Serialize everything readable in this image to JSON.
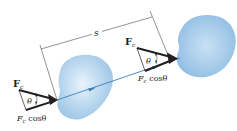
{
  "diagram": {
    "displacement_label": "s",
    "positions": [
      {
        "id": "initial",
        "force_label": "F",
        "force_subscript": "c",
        "angle_label": "θ",
        "component_label_main": "F",
        "component_label_sub": "c",
        "component_label_tail": " cosθ"
      },
      {
        "id": "final",
        "force_label": "F",
        "force_subscript": "c",
        "angle_label": "θ",
        "component_label_main": "F",
        "component_label_sub": "c",
        "component_label_tail": " cosθ"
      }
    ],
    "colors": {
      "body_fill": "#a9cde9",
      "body_highlight": "#e6f2fa",
      "trajectory": "#3d7fb8",
      "vector": "#231f20",
      "dimension_line": "#4a4a4a"
    }
  }
}
